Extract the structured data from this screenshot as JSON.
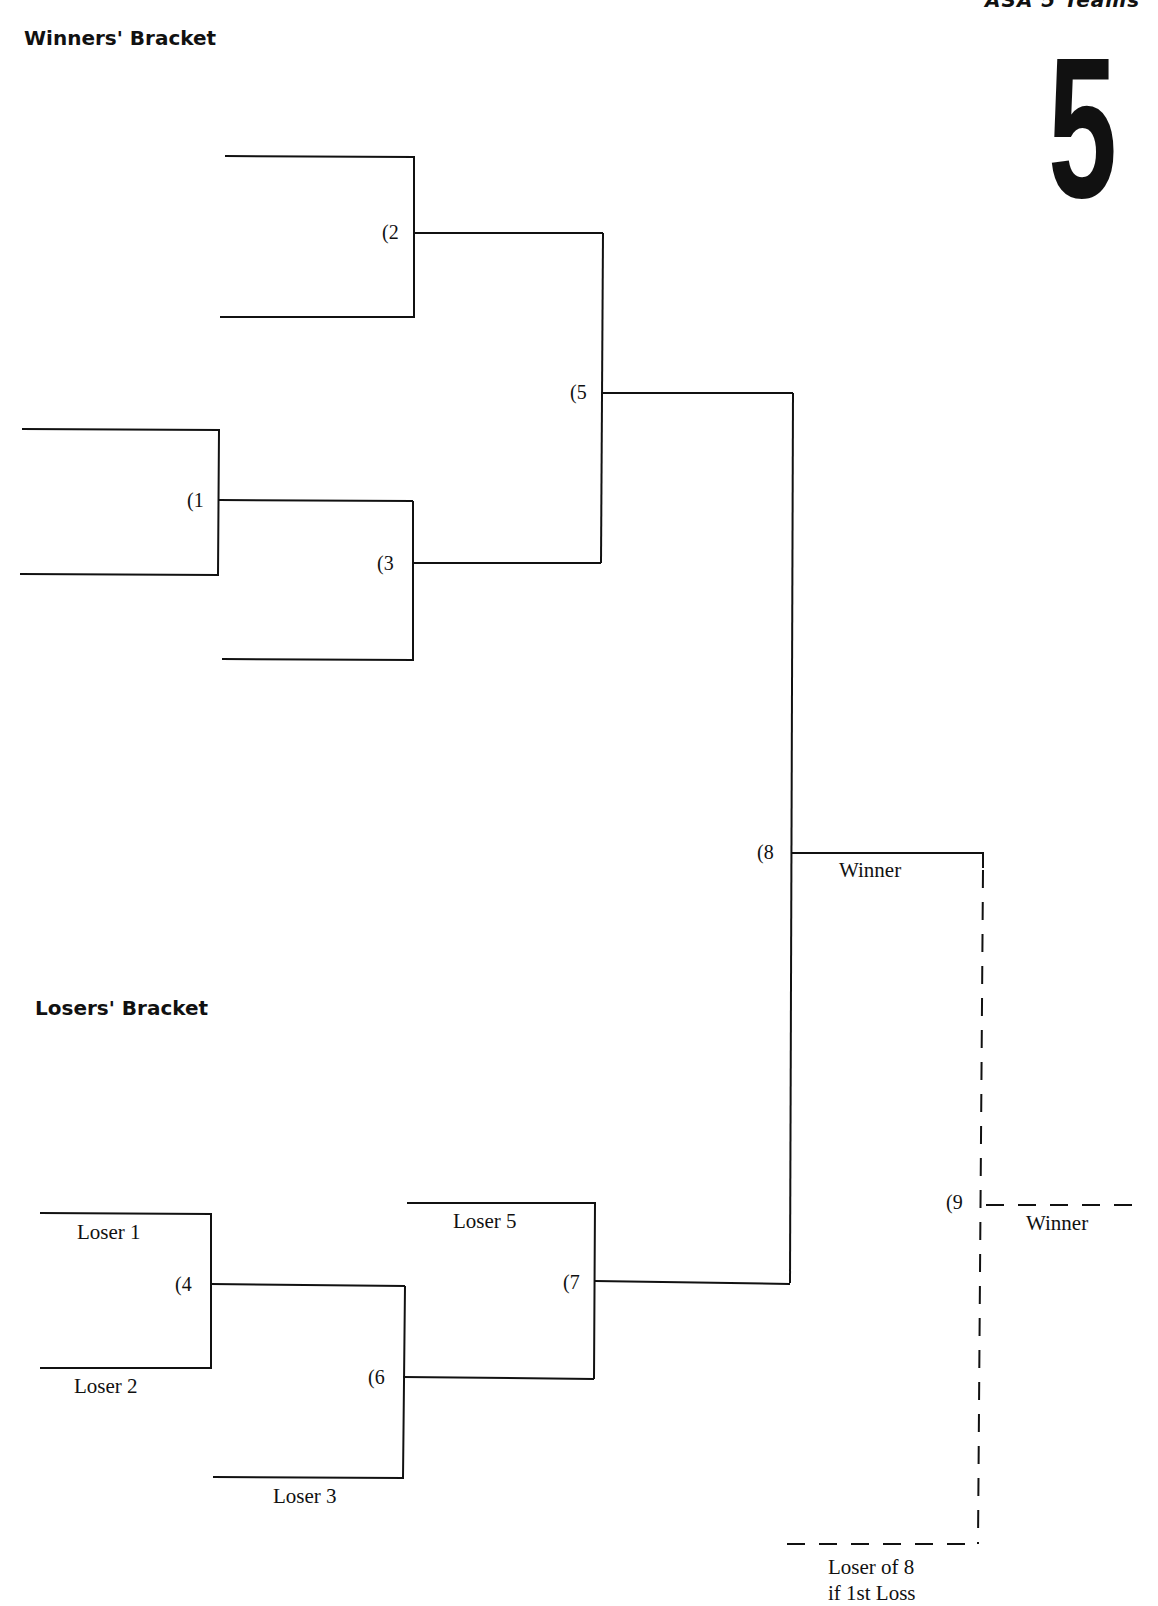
{
  "header": {
    "corner_text": "ASA 5 Teams",
    "big_number": "5"
  },
  "winners_bracket": {
    "title": "Winners' Bracket",
    "games": [
      {
        "id": 1,
        "label": "(1"
      },
      {
        "id": 2,
        "label": "(2"
      },
      {
        "id": 3,
        "label": "(3"
      },
      {
        "id": 5,
        "label": "(5"
      },
      {
        "id": 8,
        "label": "(8"
      }
    ],
    "game8_winner_label": "Winner"
  },
  "losers_bracket": {
    "title": "Losers' Bracket",
    "games": [
      {
        "id": 4,
        "label": "(4"
      },
      {
        "id": 6,
        "label": "(6"
      },
      {
        "id": 7,
        "label": "(7"
      }
    ],
    "slots": {
      "loser1": "Loser 1",
      "loser2": "Loser 2",
      "loser3": "Loser 3",
      "loser5": "Loser 5"
    }
  },
  "final": {
    "game9_label": "(9",
    "winner_label": "Winner",
    "loser_of_8_line1": "Loser of 8",
    "loser_of_8_line2": "if 1st Loss"
  },
  "colors": {
    "ink": "#111111",
    "paper": "#ffffff"
  }
}
